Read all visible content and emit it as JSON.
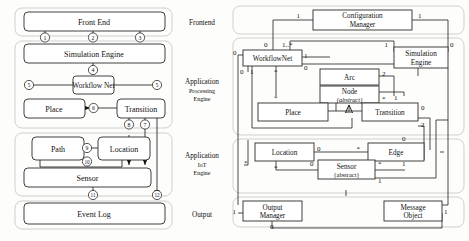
{
  "figure": {
    "type": "diagram",
    "kind": "architecture-and-uml-class-diagram",
    "panels": [
      "layered-architecture",
      "class-diagram"
    ]
  },
  "layers": [
    {
      "id": "frontend",
      "name": "Frontend",
      "lines": [
        "Frontend"
      ]
    },
    {
      "id": "processing",
      "name": "Application Processing Engine",
      "lines": [
        "Application",
        "Processing",
        "Engine"
      ]
    },
    {
      "id": "iot",
      "name": "Application IoT Engine",
      "lines": [
        "Application",
        "IoT",
        "Engine"
      ]
    },
    {
      "id": "output",
      "name": "Output",
      "lines": [
        "Output"
      ]
    }
  ],
  "left_panel": {
    "boxes": [
      {
        "id": "front-end",
        "label": "Front End",
        "layer": "frontend"
      },
      {
        "id": "simulation-engine",
        "label": "Simulation Engine",
        "layer": "processing"
      },
      {
        "id": "workflow-net",
        "label": "Workflow Net",
        "layer": "processing"
      },
      {
        "id": "place",
        "label": "Place",
        "layer": "processing"
      },
      {
        "id": "transition",
        "label": "Transition",
        "layer": "processing"
      },
      {
        "id": "path",
        "label": "Path",
        "layer": "iot"
      },
      {
        "id": "location",
        "label": "Location",
        "layer": "iot"
      },
      {
        "id": "sensor",
        "label": "Sensor",
        "layer": "iot"
      },
      {
        "id": "event-log",
        "label": "Event Log",
        "layer": "output"
      }
    ],
    "connector_labels": [
      "1",
      "2",
      "3",
      "4",
      "5",
      "5",
      "6",
      "7",
      "8",
      "9",
      "10",
      "11",
      "12"
    ],
    "connectors": [
      {
        "n": "1",
        "from": "front-end",
        "to": "simulation-engine"
      },
      {
        "n": "2",
        "from": "front-end",
        "to": "simulation-engine"
      },
      {
        "n": "3",
        "from": "front-end",
        "to": "simulation-engine"
      },
      {
        "n": "4",
        "from": "simulation-engine",
        "to": "workflow-net"
      },
      {
        "n": "5",
        "from": "place",
        "to": "workflow-net"
      },
      {
        "n": "5",
        "from": "workflow-net",
        "to": "transition"
      },
      {
        "n": "6",
        "from": "transition",
        "to": "place"
      },
      {
        "n": "7",
        "from": "transition",
        "to": "sensor"
      },
      {
        "n": "8",
        "from": "transition",
        "to": "location"
      },
      {
        "n": "9",
        "from": "path",
        "to": "location"
      },
      {
        "n": "10",
        "from": "path",
        "to": "sensor"
      },
      {
        "n": "11",
        "from": "sensor",
        "to": "event-log"
      },
      {
        "n": "12",
        "from": "transition",
        "to": "event-log"
      }
    ]
  },
  "right_panel": {
    "classes": [
      {
        "id": "configuration-manager",
        "lines": [
          "Configuration",
          "Manager"
        ],
        "stereotype": "",
        "layer": "frontend"
      },
      {
        "id": "workflownet",
        "lines": [
          "WorkflowNet"
        ],
        "stereotype": "",
        "layer": "processing"
      },
      {
        "id": "simulation-engine",
        "lines": [
          "Simulation",
          "Engine"
        ],
        "stereotype": "",
        "layer": "processing"
      },
      {
        "id": "arc",
        "lines": [
          "Arc"
        ],
        "stereotype": "",
        "layer": "processing"
      },
      {
        "id": "node",
        "lines": [
          "Node"
        ],
        "stereotype": "{abstract}",
        "layer": "processing"
      },
      {
        "id": "place",
        "lines": [
          "Place"
        ],
        "stereotype": "",
        "layer": "processing"
      },
      {
        "id": "transition",
        "lines": [
          "Transition"
        ],
        "stereotype": "",
        "layer": "processing"
      },
      {
        "id": "location",
        "lines": [
          "Location"
        ],
        "stereotype": "",
        "layer": "iot"
      },
      {
        "id": "edge",
        "lines": [
          "Edge"
        ],
        "stereotype": "",
        "layer": "iot"
      },
      {
        "id": "sensor",
        "lines": [
          "Sensor"
        ],
        "stereotype": "{abstract}",
        "layer": "iot"
      },
      {
        "id": "output-manager",
        "lines": [
          "Output",
          "Manager"
        ],
        "stereotype": "",
        "layer": "output"
      },
      {
        "id": "message-object",
        "lines": [
          "Message",
          "Object"
        ],
        "stereotype": "",
        "layer": "output"
      }
    ],
    "multiplicities": [
      "1",
      "1",
      "0",
      "1..*",
      "1",
      "0",
      "0",
      "1",
      "0",
      "0",
      "1",
      "*",
      "*",
      "2",
      "*",
      "1",
      "0",
      "2",
      "0",
      "*",
      "0",
      "*",
      "*",
      "0",
      "*",
      "1",
      "1",
      "1",
      "0"
    ]
  }
}
